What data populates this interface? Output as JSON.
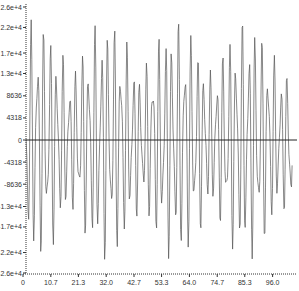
{
  "chart_data": {
    "type": "line",
    "title": "",
    "xlabel": "",
    "ylabel": "",
    "xlim": [
      0,
      105
    ],
    "ylim": [
      -26000,
      26000
    ],
    "grid": false,
    "legend": null,
    "x_ticks": [
      "0",
      "10.7",
      "21.3",
      "32.0",
      "42.7",
      "53.3",
      "64.0",
      "74.7",
      "85.3",
      "96.0"
    ],
    "x_tick_values": [
      0,
      10.7,
      21.3,
      32.0,
      42.7,
      53.3,
      64.0,
      74.7,
      85.3,
      96.0
    ],
    "y_ticks": [
      "2.6e+4",
      "2.2e+4",
      "1.7e+4",
      "1.3e+4",
      "8636",
      "4318",
      "0",
      "-4318",
      "-8636",
      "-1.3e+4",
      "-1.7e+4",
      "-2.2e+4",
      "-2.6e+4"
    ],
    "y_tick_values": [
      26000,
      22000,
      17000,
      13000,
      8636,
      4318,
      0,
      -4318,
      -8636,
      -13000,
      -17000,
      -22000,
      -26000
    ],
    "zero_line": true,
    "series": [
      {
        "name": "signal",
        "color": "#555555",
        "description": "oscillating waveform with beating envelope, approx. 4 bursts across range, peaks up to about +2.6e+4 and troughs near -2.6e+4"
      }
    ]
  },
  "colors": {
    "axis": "#333333",
    "line": "#555555",
    "zero_line": "#222222",
    "background": "#ffffff"
  }
}
